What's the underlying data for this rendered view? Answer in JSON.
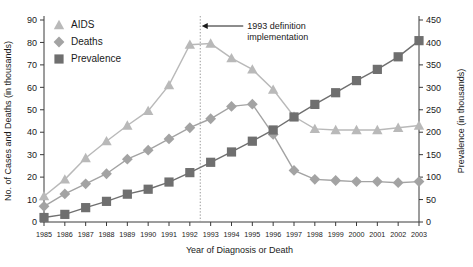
{
  "chart_data": {
    "type": "line",
    "title": "",
    "xlabel": "Year of Diagnosis or Death",
    "ylabel": "No. of Cases and Deaths (in thousands)",
    "y2label": "Prevalence (in thousands)",
    "grid": false,
    "legend_position": "top-left",
    "x": [
      1985,
      1986,
      1987,
      1988,
      1989,
      1990,
      1991,
      1992,
      1993,
      1994,
      1995,
      1996,
      1997,
      1998,
      1999,
      2000,
      2001,
      2002,
      2003
    ],
    "xtick_labels": [
      "1985",
      "1986",
      "1987",
      "1988",
      "1989",
      "1990",
      "1991",
      "1992",
      "1993",
      "1994",
      "1995",
      "1996",
      "1997",
      "1998",
      "1999",
      "2000",
      "2001",
      "2002",
      "2003"
    ],
    "ylim": [
      0,
      90
    ],
    "ytick_labels": [
      "0",
      "10",
      "20",
      "30",
      "40",
      "50",
      "60",
      "70",
      "80",
      "90"
    ],
    "y2lim": [
      0,
      450
    ],
    "y2tick_labels": [
      "0",
      "50",
      "100",
      "150",
      "200",
      "250",
      "300",
      "350",
      "400",
      "450"
    ],
    "series": [
      {
        "name": "AIDS",
        "axis": "left",
        "marker": "triangle",
        "color": "#b9b9b9",
        "values": [
          11.5,
          19.0,
          28.5,
          36.0,
          43.0,
          49.5,
          61.0,
          79.0,
          79.5,
          73.0,
          68.0,
          59.0,
          47.0,
          41.5,
          41.0,
          41.0,
          41.0,
          42.0,
          43.0
        ]
      },
      {
        "name": "Deaths",
        "axis": "left",
        "marker": "diamond",
        "color": "#a3a3a3",
        "values": [
          7.0,
          12.5,
          17.0,
          21.5,
          28.0,
          32.0,
          37.0,
          42.0,
          46.0,
          51.5,
          52.5,
          39.0,
          23.0,
          19.0,
          18.5,
          18.0,
          18.0,
          17.5,
          18.0
        ]
      },
      {
        "name": "Prevalence",
        "axis": "right",
        "marker": "square",
        "color": "#6f6f6f",
        "values": [
          10,
          17,
          32,
          46,
          62,
          73,
          89,
          110,
          133,
          156,
          180,
          205,
          234,
          262,
          288,
          315,
          340,
          368,
          404
        ]
      }
    ],
    "annotations": [
      {
        "name": "definition-change",
        "line1": "1993 definition",
        "line2": "implementation",
        "x_at": 1992.5,
        "style": "dotted-vertical-with-arrow"
      }
    ]
  },
  "legend": {
    "items": [
      {
        "label": "AIDS"
      },
      {
        "label": "Deaths"
      },
      {
        "label": "Prevalence"
      }
    ]
  }
}
